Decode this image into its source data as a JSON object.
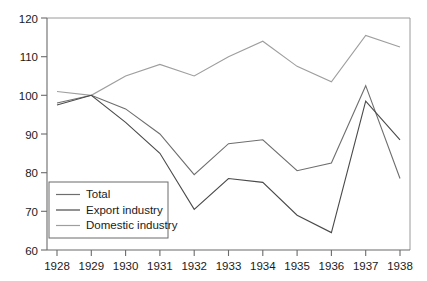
{
  "chart_data": {
    "type": "line",
    "title": "",
    "subtitle": "",
    "xlabel": "",
    "ylabel": "",
    "categories": [
      "1928",
      "1929",
      "1930",
      "1931",
      "1932",
      "1933",
      "1934",
      "1935",
      "1936",
      "1937",
      "1938"
    ],
    "x": [
      1928,
      1929,
      1930,
      1931,
      1932,
      1933,
      1934,
      1935,
      1936,
      1937,
      1938
    ],
    "xlim": [
      1927.6,
      1938.6
    ],
    "ylim": [
      60,
      120
    ],
    "ytick_labels": [
      "60",
      "70",
      "80",
      "90",
      "100",
      "110",
      "120"
    ],
    "yticks": [
      60,
      70,
      80,
      90,
      100,
      110,
      120
    ],
    "grid": false,
    "legend_position": "lower-left-inside",
    "series": [
      {
        "name": "Total",
        "color": "#6e6e6e",
        "values": [
          98.0,
          100.0,
          96.5,
          90.0,
          79.5,
          87.5,
          88.5,
          80.5,
          82.5,
          102.5,
          78.5
        ]
      },
      {
        "name": "Export industry",
        "color": "#4a4a4a",
        "values": [
          97.5,
          100.0,
          93.0,
          85.0,
          70.5,
          78.5,
          77.5,
          69.0,
          64.5,
          98.5,
          88.5
        ]
      },
      {
        "name": "Domestic industry",
        "color": "#9e9e9e",
        "values": [
          101.0,
          100.0,
          105.0,
          108.0,
          105.0,
          110.0,
          114.0,
          107.5,
          103.5,
          115.5,
          112.5
        ]
      }
    ],
    "legend_entries": [
      "Total",
      "Export industry",
      "Domestic industry"
    ],
    "axis_color": "#6b6b6b",
    "frame_color": "#9a9a9a",
    "background_color": "#ffffff"
  }
}
